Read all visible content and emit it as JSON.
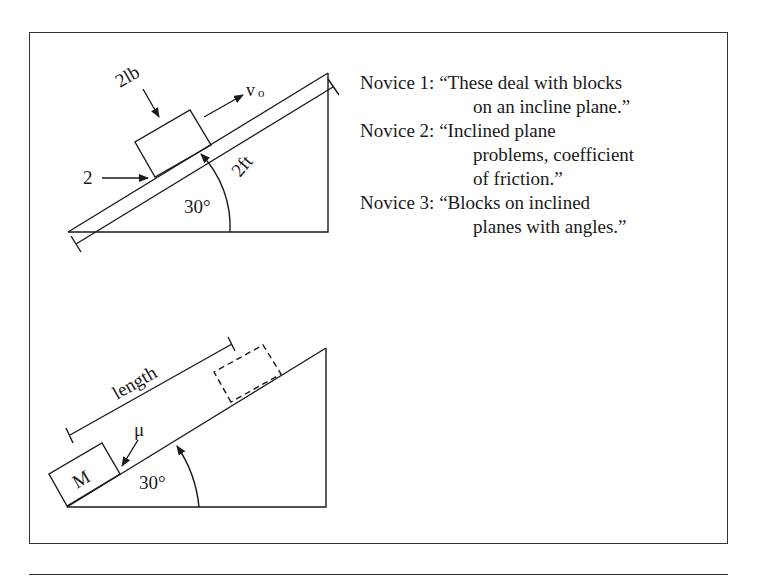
{
  "top_diagram": {
    "weight_label": "2lb",
    "velocity_label": "v",
    "velocity_subscript": "o",
    "force_label": "2",
    "length_label": "2ft",
    "angle_label": "30°"
  },
  "bottom_diagram": {
    "length_label": "length",
    "friction_label": "μ",
    "mass_label": "M",
    "angle_label": "30°"
  },
  "novice_quotes": [
    {
      "label": "Novice 1:",
      "lines": [
        "“These deal with blocks",
        "on an incline plane.”"
      ]
    },
    {
      "label": "Novice 2:",
      "lines": [
        "“Inclined plane",
        "problems, coefficient",
        "of friction.”"
      ]
    },
    {
      "label": "Novice 3:",
      "lines": [
        "“Blocks on inclined",
        "planes with angles.”"
      ]
    }
  ],
  "colors": {
    "ink": "#1a1a1a",
    "frame": "#333333",
    "background": "#ffffff"
  }
}
